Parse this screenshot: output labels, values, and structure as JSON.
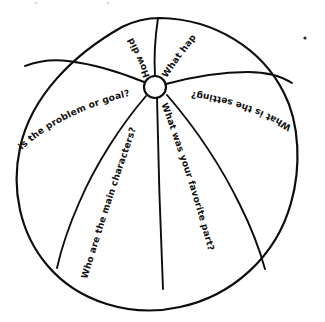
{
  "diagram": {
    "kind": "hand-drawn-beach-ball",
    "center_hub": {
      "label": "",
      "cx": 155,
      "cy": 87,
      "r": 11
    },
    "ball": {
      "cx": 157,
      "cy": 164,
      "rx": 140,
      "ry": 146
    },
    "segments": [
      {
        "id": "seg-how-did-it",
        "position": "top-left",
        "question": "How did it"
      },
      {
        "id": "seg-what-hap",
        "position": "top-right",
        "question": "What hap"
      },
      {
        "id": "seg-setting",
        "position": "right-upper",
        "question": "What is the setting?"
      },
      {
        "id": "seg-favorite-part",
        "position": "bottom-right",
        "question": "What was your favorite part?"
      },
      {
        "id": "seg-main-characters",
        "position": "bottom-left",
        "question": "Who are the main characters?"
      },
      {
        "id": "seg-problem-or-goal",
        "position": "left-upper",
        "question": "is the problem or goal?"
      }
    ],
    "ink_color": "#0d0d0d",
    "paper_color": "#ffffff",
    "stray_marks": [
      {
        "id": "speck-top-right",
        "x": 305,
        "y": 38,
        "r": 1.6
      },
      {
        "id": "speck-top-edge-left",
        "x": 36,
        "y": 3,
        "r": 1.3
      },
      {
        "id": "speck-top-edge-mid",
        "x": 108,
        "y": 3,
        "r": 1.2
      }
    ]
  }
}
